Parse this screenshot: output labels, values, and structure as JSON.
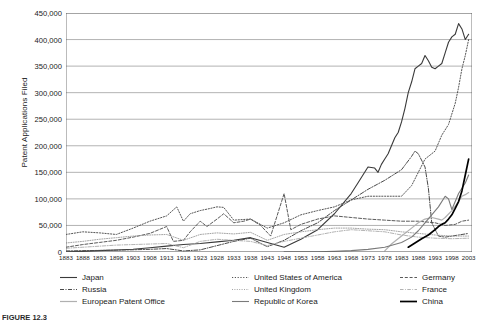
{
  "figure": {
    "caption": "FIGURE 12.3"
  },
  "axes": {
    "ylabel": "Patent Applications Filed",
    "xlabel": "",
    "yticks": [
      "0",
      "50,000",
      "100,000",
      "150,000",
      "200,000",
      "250,000",
      "300,000",
      "350,000",
      "400,000",
      "450,000"
    ],
    "xticks": [
      "1883",
      "1888",
      "1893",
      "1898",
      "1903",
      "1908",
      "1913",
      "1918",
      "1923",
      "1928",
      "1933",
      "1938",
      "1943",
      "1948",
      "1953",
      "1958",
      "1963",
      "1968",
      "1973",
      "1978",
      "1983",
      "1988",
      "1993",
      "1998",
      "2003"
    ]
  },
  "legend": {
    "position": "bottom",
    "columns": 3,
    "entries": [
      {
        "label": "Japan",
        "style": "solid",
        "color": "#3a3a3a",
        "width": 1.1
      },
      {
        "label": "United States of America",
        "style": "dotted",
        "color": "#555555",
        "width": 1.0
      },
      {
        "label": "Germany",
        "style": "dashed",
        "color": "#5a5a5a",
        "width": 1.0
      },
      {
        "label": "Russia",
        "style": "dashdot",
        "color": "#4a4a4a",
        "width": 1.0
      },
      {
        "label": "United Kingdom",
        "style": "dotted-fine",
        "color": "#9a9a9a",
        "width": 0.9
      },
      {
        "label": "France",
        "style": "dashdot-light",
        "color": "#aaaaaa",
        "width": 0.9
      },
      {
        "label": "European Patent Office",
        "style": "solid",
        "color": "#b0b0b0",
        "width": 1.2
      },
      {
        "label": "Republic of Korea",
        "style": "solid",
        "color": "#7a7a7a",
        "width": 1.1
      },
      {
        "label": "China",
        "style": "solid",
        "color": "#000000",
        "width": 1.7
      }
    ]
  },
  "chart_data": {
    "type": "line",
    "title": "",
    "xlabel": "",
    "ylabel": "Patent Applications Filed",
    "xlim": [
      1883,
      2004
    ],
    "ylim": [
      0,
      450000
    ],
    "ytick_step": 50000,
    "xtick_step": 5,
    "grid": "horizontal",
    "series": [
      {
        "name": "Japan",
        "color": "#3a3a3a",
        "style": "solid",
        "points": [
          [
            1883,
            300
          ],
          [
            1888,
            1200
          ],
          [
            1893,
            2500
          ],
          [
            1898,
            3800
          ],
          [
            1903,
            5200
          ],
          [
            1908,
            8000
          ],
          [
            1913,
            11000
          ],
          [
            1918,
            14000
          ],
          [
            1923,
            16000
          ],
          [
            1928,
            19000
          ],
          [
            1933,
            22000
          ],
          [
            1938,
            27000
          ],
          [
            1943,
            18000
          ],
          [
            1948,
            9000
          ],
          [
            1953,
            24000
          ],
          [
            1958,
            42000
          ],
          [
            1963,
            72000
          ],
          [
            1968,
            110000
          ],
          [
            1970,
            130000
          ],
          [
            1973,
            160000
          ],
          [
            1975,
            158000
          ],
          [
            1976,
            150000
          ],
          [
            1977,
            165000
          ],
          [
            1978,
            175000
          ],
          [
            1979,
            185000
          ],
          [
            1980,
            200000
          ],
          [
            1981,
            215000
          ],
          [
            1982,
            225000
          ],
          [
            1983,
            245000
          ],
          [
            1984,
            270000
          ],
          [
            1985,
            300000
          ],
          [
            1986,
            320000
          ],
          [
            1987,
            345000
          ],
          [
            1988,
            350000
          ],
          [
            1989,
            355000
          ],
          [
            1990,
            370000
          ],
          [
            1991,
            360000
          ],
          [
            1992,
            348000
          ],
          [
            1993,
            345000
          ],
          [
            1994,
            350000
          ],
          [
            1995,
            355000
          ],
          [
            1996,
            375000
          ],
          [
            1997,
            395000
          ],
          [
            1998,
            405000
          ],
          [
            1999,
            410000
          ],
          [
            2000,
            430000
          ],
          [
            2001,
            420000
          ],
          [
            2002,
            400000
          ],
          [
            2003,
            410000
          ]
        ]
      },
      {
        "name": "United States of America",
        "color": "#555555",
        "style": "dotted",
        "points": [
          [
            1883,
            33000
          ],
          [
            1888,
            38000
          ],
          [
            1893,
            36000
          ],
          [
            1898,
            33000
          ],
          [
            1903,
            45000
          ],
          [
            1908,
            58000
          ],
          [
            1913,
            68000
          ],
          [
            1916,
            85000
          ],
          [
            1918,
            58000
          ],
          [
            1920,
            72000
          ],
          [
            1923,
            78000
          ],
          [
            1926,
            82000
          ],
          [
            1928,
            85000
          ],
          [
            1930,
            84000
          ],
          [
            1933,
            60000
          ],
          [
            1938,
            62000
          ],
          [
            1943,
            45000
          ],
          [
            1948,
            55000
          ],
          [
            1953,
            70000
          ],
          [
            1958,
            78000
          ],
          [
            1963,
            85000
          ],
          [
            1968,
            98000
          ],
          [
            1973,
            105000
          ],
          [
            1978,
            105000
          ],
          [
            1983,
            105000
          ],
          [
            1986,
            125000
          ],
          [
            1988,
            150000
          ],
          [
            1990,
            175000
          ],
          [
            1993,
            190000
          ],
          [
            1995,
            220000
          ],
          [
            1997,
            240000
          ],
          [
            1999,
            280000
          ],
          [
            2000,
            310000
          ],
          [
            2001,
            345000
          ],
          [
            2002,
            370000
          ],
          [
            2003,
            400000
          ]
        ]
      },
      {
        "name": "Germany",
        "color": "#5a5a5a",
        "style": "dashed",
        "points": [
          [
            1883,
            9000
          ],
          [
            1888,
            14000
          ],
          [
            1893,
            18000
          ],
          [
            1898,
            22000
          ],
          [
            1903,
            28000
          ],
          [
            1908,
            35000
          ],
          [
            1913,
            48000
          ],
          [
            1915,
            20000
          ],
          [
            1918,
            22000
          ],
          [
            1920,
            38000
          ],
          [
            1923,
            58000
          ],
          [
            1925,
            48000
          ],
          [
            1928,
            62000
          ],
          [
            1930,
            72000
          ],
          [
            1933,
            55000
          ],
          [
            1936,
            58000
          ],
          [
            1938,
            62000
          ],
          [
            1941,
            50000
          ],
          [
            1944,
            30000
          ],
          [
            1948,
            110000
          ],
          [
            1950,
            42000
          ],
          [
            1953,
            52000
          ],
          [
            1958,
            62000
          ],
          [
            1963,
            68000
          ],
          [
            1968,
            65000
          ],
          [
            1973,
            62000
          ],
          [
            1978,
            60000
          ],
          [
            1983,
            58000
          ],
          [
            1988,
            58000
          ],
          [
            1993,
            55000
          ],
          [
            1996,
            50000
          ],
          [
            1999,
            52000
          ],
          [
            2001,
            58000
          ],
          [
            2003,
            60000
          ]
        ]
      },
      {
        "name": "Russia",
        "color": "#4a4a4a",
        "style": "dashdot",
        "points": [
          [
            1883,
            2000
          ],
          [
            1888,
            2500
          ],
          [
            1893,
            3000
          ],
          [
            1898,
            3500
          ],
          [
            1903,
            4200
          ],
          [
            1908,
            5000
          ],
          [
            1913,
            6500
          ],
          [
            1918,
            2000
          ],
          [
            1923,
            4000
          ],
          [
            1928,
            12000
          ],
          [
            1933,
            20000
          ],
          [
            1938,
            26000
          ],
          [
            1943,
            10000
          ],
          [
            1948,
            22000
          ],
          [
            1953,
            40000
          ],
          [
            1958,
            55000
          ],
          [
            1963,
            78000
          ],
          [
            1968,
            98000
          ],
          [
            1973,
            118000
          ],
          [
            1978,
            135000
          ],
          [
            1983,
            155000
          ],
          [
            1986,
            180000
          ],
          [
            1987,
            190000
          ],
          [
            1988,
            185000
          ],
          [
            1990,
            160000
          ],
          [
            1991,
            120000
          ],
          [
            1992,
            55000
          ],
          [
            1994,
            30000
          ],
          [
            1996,
            28000
          ],
          [
            1998,
            30000
          ],
          [
            2000,
            32000
          ],
          [
            2003,
            35000
          ]
        ]
      },
      {
        "name": "United Kingdom",
        "color": "#9a9a9a",
        "style": "dotted-fine",
        "points": [
          [
            1883,
            17000
          ],
          [
            1888,
            20000
          ],
          [
            1893,
            24000
          ],
          [
            1898,
            27000
          ],
          [
            1903,
            30000
          ],
          [
            1908,
            32000
          ],
          [
            1913,
            33000
          ],
          [
            1918,
            22000
          ],
          [
            1923,
            33000
          ],
          [
            1928,
            36000
          ],
          [
            1933,
            34000
          ],
          [
            1938,
            37000
          ],
          [
            1943,
            22000
          ],
          [
            1948,
            33000
          ],
          [
            1953,
            38000
          ],
          [
            1958,
            42000
          ],
          [
            1963,
            45000
          ],
          [
            1968,
            45000
          ],
          [
            1973,
            43000
          ],
          [
            1978,
            42000
          ],
          [
            1983,
            38000
          ],
          [
            1988,
            35000
          ],
          [
            1993,
            32000
          ],
          [
            1998,
            30000
          ],
          [
            2003,
            30000
          ]
        ]
      },
      {
        "name": "France",
        "color": "#aaaaaa",
        "style": "dashdot-light",
        "points": [
          [
            1883,
            7000
          ],
          [
            1888,
            9000
          ],
          [
            1893,
            11000
          ],
          [
            1898,
            13000
          ],
          [
            1903,
            14000
          ],
          [
            1908,
            15000
          ],
          [
            1913,
            16000
          ],
          [
            1918,
            8000
          ],
          [
            1923,
            20000
          ],
          [
            1928,
            24000
          ],
          [
            1933,
            22000
          ],
          [
            1938,
            20000
          ],
          [
            1943,
            12000
          ],
          [
            1948,
            20000
          ],
          [
            1953,
            26000
          ],
          [
            1958,
            32000
          ],
          [
            1963,
            38000
          ],
          [
            1968,
            42000
          ],
          [
            1973,
            40000
          ],
          [
            1978,
            38000
          ],
          [
            1983,
            32000
          ],
          [
            1988,
            28000
          ],
          [
            1993,
            26000
          ],
          [
            1998,
            25000
          ],
          [
            2003,
            26000
          ]
        ]
      },
      {
        "name": "European Patent Office",
        "color": "#b0b0b0",
        "style": "solid",
        "points": [
          [
            1978,
            2000
          ],
          [
            1980,
            15000
          ],
          [
            1983,
            30000
          ],
          [
            1986,
            45000
          ],
          [
            1988,
            55000
          ],
          [
            1990,
            62000
          ],
          [
            1992,
            65000
          ],
          [
            1994,
            62000
          ],
          [
            1995,
            60000
          ],
          [
            1996,
            65000
          ],
          [
            1998,
            78000
          ],
          [
            2000,
            95000
          ],
          [
            2001,
            105000
          ],
          [
            2002,
            108000
          ],
          [
            2003,
            112000
          ]
        ]
      },
      {
        "name": "Republic of Korea",
        "color": "#7a7a7a",
        "style": "solid",
        "points": [
          [
            1948,
            200
          ],
          [
            1958,
            600
          ],
          [
            1963,
            1200
          ],
          [
            1968,
            2500
          ],
          [
            1973,
            5000
          ],
          [
            1978,
            9000
          ],
          [
            1983,
            18000
          ],
          [
            1986,
            28000
          ],
          [
            1988,
            40000
          ],
          [
            1990,
            55000
          ],
          [
            1992,
            70000
          ],
          [
            1994,
            85000
          ],
          [
            1996,
            105000
          ],
          [
            1997,
            100000
          ],
          [
            1998,
            80000
          ],
          [
            1999,
            95000
          ],
          [
            2000,
            110000
          ],
          [
            2001,
            120000
          ],
          [
            2002,
            130000
          ],
          [
            2003,
            145000
          ]
        ]
      },
      {
        "name": "China",
        "color": "#000000",
        "style": "solid",
        "points": [
          [
            1985,
            9000
          ],
          [
            1987,
            17000
          ],
          [
            1989,
            25000
          ],
          [
            1991,
            32000
          ],
          [
            1993,
            42000
          ],
          [
            1994,
            48000
          ],
          [
            1995,
            52000
          ],
          [
            1996,
            55000
          ],
          [
            1997,
            62000
          ],
          [
            1998,
            70000
          ],
          [
            1999,
            82000
          ],
          [
            2000,
            95000
          ],
          [
            2001,
            115000
          ],
          [
            2002,
            145000
          ],
          [
            2003,
            175000
          ]
        ]
      }
    ]
  }
}
